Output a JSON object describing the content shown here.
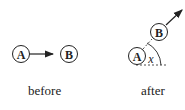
{
  "before": {
    "caption": "before",
    "node_a": "A",
    "node_b": "B"
  },
  "after": {
    "caption": "after",
    "node_a": "A",
    "node_b": "B",
    "angle_label": "x"
  },
  "colors": {
    "stroke": "#222222",
    "background": "#ffffff"
  }
}
